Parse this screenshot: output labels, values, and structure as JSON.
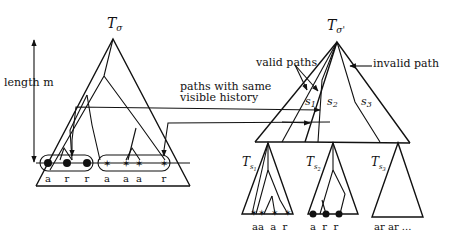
{
  "figure": {
    "left_tree": {
      "title": "T",
      "title_sub": "σ",
      "height_label": "length m",
      "leaves_group_1": [
        "a",
        "r",
        "r"
      ],
      "leaves_group_2": [
        "a",
        "a",
        "a",
        "r"
      ],
      "group_1_marker": "filled-circle",
      "group_2_marker": "star"
    },
    "right_tree": {
      "title": "T",
      "title_sub": "σ'",
      "nodes": [
        "s1",
        "s2",
        "s3"
      ],
      "node_labels": [
        {
          "base": "s",
          "sub": "1"
        },
        {
          "base": "s",
          "sub": "2"
        },
        {
          "base": "s",
          "sub": "3"
        }
      ],
      "annotation_valid": "valid paths",
      "annotation_invalid": "invalid path"
    },
    "connector_label_line1": "paths with same",
    "connector_label_line2": "visible history",
    "subtrees": [
      {
        "title": "T",
        "title_sub": "s",
        "title_subsub": "1",
        "leaves": "aa  a  r",
        "marker": "star"
      },
      {
        "title": "T",
        "title_sub": "s",
        "title_subsub": "2",
        "leaves": "a  r  r",
        "marker": "filled-circle"
      },
      {
        "title": "T",
        "title_sub": "s",
        "title_subsub": "3",
        "leaves": "ar ar ..."
      }
    ]
  }
}
